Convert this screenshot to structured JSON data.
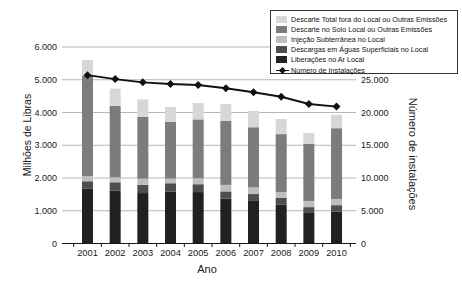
{
  "chart_data": {
    "type": "bar",
    "subtype": "stacked-bars-with-line-overlay",
    "title": "",
    "xlabel": "Ano",
    "ylabel_left": "Milhões de Libras",
    "ylabel_right": "Número de instalações",
    "categories": [
      "2001",
      "2002",
      "2003",
      "2004",
      "2005",
      "2006",
      "2007",
      "2008",
      "2009",
      "2010"
    ],
    "left_axis": {
      "min": 0,
      "max": 6000,
      "tick_labels": [
        "0",
        "1.000",
        "2.000",
        "3.000",
        "4.000",
        "5.000",
        "6.000"
      ]
    },
    "right_axis": {
      "min": 0,
      "max": 25000,
      "tick_labels": [
        "0",
        "5.000",
        "10.000",
        "15.000",
        "20.000",
        "25.000"
      ]
    },
    "grid": "horizontal-on",
    "legend_position": "top-right-box",
    "series": [
      {
        "name": "Liberações no Ar Local",
        "color": "#212121",
        "values": [
          1670,
          1610,
          1540,
          1590,
          1570,
          1370,
          1300,
          1180,
          930,
          970
        ]
      },
      {
        "name": "Descargas em Águas Superficiais no Local",
        "color": "#4e4e4e",
        "values": [
          230,
          260,
          250,
          250,
          240,
          220,
          210,
          210,
          180,
          200
        ]
      },
      {
        "name": "Injeção Subterrânea no Local",
        "color": "#bcc0bc",
        "values": [
          160,
          150,
          190,
          140,
          180,
          200,
          200,
          180,
          190,
          190
        ]
      },
      {
        "name": "Descarte no Solo Local ou Outras Emissões",
        "color": "#7c7c7c",
        "values": [
          3060,
          2180,
          1890,
          1730,
          1800,
          1960,
          1840,
          1770,
          1740,
          2160
        ]
      },
      {
        "name": "Descarte Total fora do Local ou Outras Emissões",
        "color": "#d7d7d7",
        "values": [
          480,
          530,
          530,
          460,
          500,
          510,
          500,
          460,
          330,
          410
        ]
      }
    ],
    "bar_totals": [
      5600,
      4730,
      4400,
      4170,
      4290,
      4260,
      4050,
      3800,
      3370,
      3930
    ],
    "line_series": {
      "name": "Número de Instalações",
      "color": "#111111",
      "values": [
        25700,
        25100,
        24600,
        24350,
        24200,
        23700,
        23100,
        22400,
        21300,
        20900
      ]
    },
    "legend": [
      {
        "label": "Descarte Total fora do Local ou Outras Emissões",
        "color": "#d7d7d7",
        "marker": "square"
      },
      {
        "label": "Descarte no Solo Local ou Outras Emissões",
        "color": "#7c7c7c",
        "marker": "square"
      },
      {
        "label": "Injeção Subterrânea no Local",
        "color": "#bcc0bc",
        "marker": "square"
      },
      {
        "label": "Descargas em Águas Superficiais no Local",
        "color": "#4e4e4e",
        "marker": "square"
      },
      {
        "label": "Liberações no Ar Local",
        "color": "#212121",
        "marker": "square"
      },
      {
        "label": "Número de Instalações",
        "color": "#111111",
        "marker": "line-diamond"
      }
    ]
  }
}
